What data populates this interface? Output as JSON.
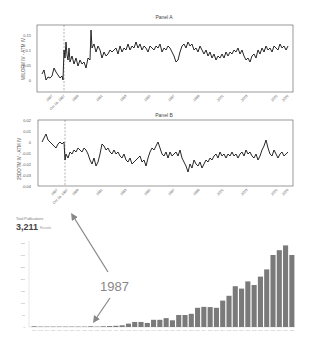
{
  "chart_data": [
    {
      "type": "line",
      "title": "Panel A",
      "ylabel": "WILOFM IV - ATM IV",
      "xlabel": "",
      "ylim": [
        -0.03,
        0.17
      ],
      "yticks": [
        "0",
        "0.05",
        "0.1",
        "0.15"
      ],
      "xticks": [
        "1987",
        "Oct 19, 1987",
        "1989",
        "1991",
        "1993",
        "1995",
        "1997",
        "1999",
        "2001",
        "2003",
        "2005",
        "2006"
      ],
      "annotations": [
        {
          "type": "vline-dashed",
          "x": "Oct 19, 1987"
        }
      ],
      "grid": false,
      "series": [
        {
          "name": "Panel A",
          "x": [
            1986.9,
            1987.2,
            1987.5,
            1987.8,
            1988.0,
            1988.5,
            1989.0,
            1989.5,
            1990.0,
            1990.5,
            1991.0,
            1992.0,
            1993.0,
            1994.0,
            1995.0,
            1996.0,
            1997.0,
            1997.5,
            1998.0,
            1999.0,
            2000.0,
            2001.0,
            2002.0,
            2003.0,
            2004.0,
            2005.0,
            2006.0
          ],
          "values": [
            0.02,
            0.01,
            0.04,
            0.02,
            0.09,
            0.06,
            0.05,
            0.06,
            0.1,
            0.08,
            0.09,
            0.09,
            0.1,
            0.1,
            0.1,
            0.09,
            0.07,
            0.06,
            0.1,
            0.11,
            0.09,
            0.08,
            0.07,
            0.06,
            0.09,
            0.1,
            0.1
          ]
        }
      ]
    },
    {
      "type": "line",
      "title": "Panel B",
      "ylabel": "25DOTM IV - ATM IV",
      "xlabel": "",
      "ylim": [
        -0.04,
        0.02
      ],
      "yticks": [
        "-0.04",
        "-0.03",
        "-0.02",
        "-0.01",
        "0",
        "0.01",
        "0.02"
      ],
      "xticks": [
        "1987",
        "Oct 19, 1987",
        "1989",
        "1991",
        "1993",
        "1995",
        "1997",
        "1999",
        "2001",
        "2003",
        "2005",
        "2006"
      ],
      "annotations": [
        {
          "type": "vline-dashed",
          "x": "Oct 19, 1987"
        }
      ],
      "grid": false,
      "series": [
        {
          "name": "Panel B",
          "x": [
            1986.9,
            1987.2,
            1987.5,
            1987.8,
            1988.0,
            1988.5,
            1989.0,
            1989.5,
            1990.0,
            1990.5,
            1991.0,
            1992.0,
            1993.0,
            1994.0,
            1995.0,
            1996.0,
            1997.0,
            1997.5,
            1998.0,
            1999.0,
            2000.0,
            2001.0,
            2002.0,
            2003.0,
            2004.0,
            2005.0,
            2006.0
          ],
          "values": [
            0.0,
            0.005,
            -0.003,
            0.0,
            -0.015,
            -0.01,
            -0.008,
            -0.02,
            -0.015,
            -0.005,
            -0.01,
            -0.012,
            -0.02,
            -0.015,
            -0.005,
            -0.015,
            -0.01,
            -0.025,
            -0.02,
            -0.018,
            -0.015,
            -0.01,
            -0.012,
            -0.01,
            -0.005,
            -0.015,
            -0.01
          ]
        }
      ]
    },
    {
      "type": "bar",
      "title": "Total Publications",
      "total_label": "Total Publications",
      "total_value": "3,211",
      "total_unit": "Records",
      "xlabel": "",
      "ylabel": "",
      "ylim": [
        0,
        350
      ],
      "yticks": [
        "0",
        "50",
        "100",
        "150",
        "200",
        "250",
        "300",
        "350"
      ],
      "annotations": [
        {
          "text": "1987",
          "type": "arrows",
          "targets": [
            "bar near 1987",
            "Total Publications count"
          ]
        }
      ],
      "grid": false,
      "categories": [
        "1977",
        "1978",
        "1979",
        "1980",
        "1981",
        "1982",
        "1983",
        "1984",
        "1985",
        "1986",
        "1987",
        "1988",
        "1989",
        "1990",
        "1991",
        "1992",
        "1993",
        "1994",
        "1995",
        "1996",
        "1997",
        "1998",
        "1999",
        "2000",
        "2001",
        "2002",
        "2003",
        "2004",
        "2005",
        "2006",
        "2007",
        "2008",
        "2009",
        "2010",
        "2011",
        "2012",
        "2013",
        "2014",
        "2015",
        "2016",
        "2017",
        "2018"
      ],
      "values": [
        3,
        1,
        0,
        0,
        0,
        0,
        1,
        0,
        1,
        3,
        1,
        3,
        4,
        5,
        7,
        14,
        21,
        21,
        17,
        30,
        30,
        37,
        28,
        50,
        50,
        55,
        80,
        84,
        83,
        80,
        110,
        130,
        170,
        160,
        190,
        175,
        210,
        240,
        300,
        320,
        340,
        300
      ]
    }
  ],
  "annotation_text": "1987"
}
